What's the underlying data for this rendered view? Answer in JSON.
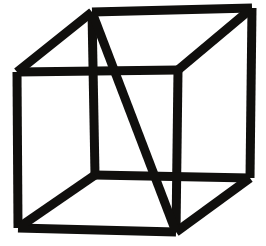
{
  "figure": {
    "name": "necker-cube",
    "canvas": {
      "width": 266,
      "height": 246
    },
    "colors": {
      "background": "#ffffff",
      "stroke": "#100f0d"
    },
    "stroke_width": 9,
    "vertices": {
      "front_top_left": {
        "x": 17,
        "y": 72
      },
      "front_top_right": {
        "x": 178,
        "y": 70
      },
      "front_bottom_right": {
        "x": 176,
        "y": 232
      },
      "front_bottom_left": {
        "x": 18,
        "y": 228
      },
      "back_top_left": {
        "x": 92,
        "y": 12
      },
      "back_top_right": {
        "x": 252,
        "y": 8
      },
      "back_bottom_right": {
        "x": 250,
        "y": 178
      },
      "back_bottom_left": {
        "x": 95,
        "y": 175
      }
    },
    "edges": [
      {
        "name": "front-face-top",
        "from": "front_top_left",
        "to": "front_top_right"
      },
      {
        "name": "front-face-right",
        "from": "front_top_right",
        "to": "front_bottom_right"
      },
      {
        "name": "front-face-bottom",
        "from": "front_bottom_right",
        "to": "front_bottom_left"
      },
      {
        "name": "front-face-left",
        "from": "front_bottom_left",
        "to": "front_top_left"
      },
      {
        "name": "back-face-top",
        "from": "back_top_left",
        "to": "back_top_right"
      },
      {
        "name": "back-face-right",
        "from": "back_top_right",
        "to": "back_bottom_right"
      },
      {
        "name": "back-face-bottom",
        "from": "back_bottom_right",
        "to": "back_bottom_left"
      },
      {
        "name": "back-face-left",
        "from": "back_bottom_left",
        "to": "back_top_left"
      },
      {
        "name": "connector-top-left",
        "from": "front_top_left",
        "to": "back_top_left"
      },
      {
        "name": "connector-top-right",
        "from": "front_top_right",
        "to": "back_top_right"
      },
      {
        "name": "connector-bottom-right",
        "from": "front_bottom_right",
        "to": "back_bottom_right"
      },
      {
        "name": "connector-bottom-left",
        "from": "front_bottom_left",
        "to": "back_bottom_left"
      },
      {
        "name": "long-diagonal",
        "from": "back_top_left",
        "to": "front_bottom_right"
      }
    ]
  }
}
